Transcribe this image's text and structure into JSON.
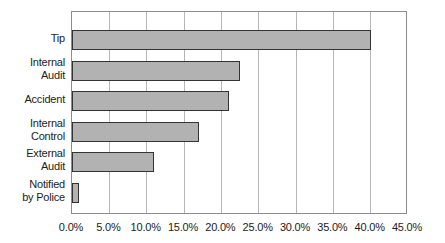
{
  "chart_data": {
    "type": "bar",
    "orientation": "horizontal",
    "title": "",
    "xlabel": "",
    "ylabel": "",
    "categories": [
      "Tip",
      "Internal\nAudit",
      "Accident",
      "Internal\nControl",
      "External\nAudit",
      "Notified\nby Police"
    ],
    "values": [
      40.0,
      22.5,
      21.0,
      17.0,
      11.0,
      1.0
    ],
    "value_unit": "%",
    "xlim": [
      0,
      45
    ],
    "x_tick_step": 5,
    "x_tick_labels": [
      "0.0%",
      "5.0%",
      "10.0%",
      "15.0%",
      "20.0%",
      "25.0%",
      "30.0%",
      "35.0%",
      "40.0%",
      "45.0%"
    ],
    "grid": "vertical",
    "legend": "none",
    "colors": {
      "background": "#ffffff",
      "bar_fill": "#b2b2b2",
      "bar_border": "#333333",
      "grid_line": "#b7b7b7",
      "axis_frame": "#8c8c8c",
      "text": "#1c1c1c"
    }
  }
}
